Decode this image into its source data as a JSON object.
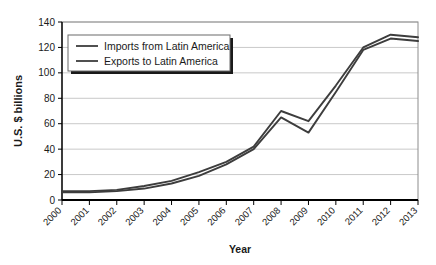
{
  "chart_data": {
    "type": "line",
    "title": "",
    "xlabel": "Year",
    "ylabel": "U.S. $ billions",
    "categories": [
      "2000",
      "2001",
      "2002",
      "2003",
      "2004",
      "2005",
      "2006",
      "2007",
      "2008",
      "2009",
      "2010",
      "2011",
      "2012",
      "2013"
    ],
    "xlim": [
      2000,
      2013
    ],
    "ylim": [
      0,
      140
    ],
    "yticks": [
      0,
      20,
      40,
      60,
      80,
      100,
      120,
      140
    ],
    "ytick_labels": [
      "0",
      "20",
      "40",
      "60",
      "80",
      "100",
      "120",
      "140"
    ],
    "grid": true,
    "grid_axis": "y",
    "legend_position": "upper-left-inside",
    "series": [
      {
        "name": "Imports from Latin America",
        "color": "#3d3d3d",
        "values": [
          7,
          7,
          8,
          11,
          15,
          22,
          30,
          42,
          70,
          62,
          90,
          120,
          130,
          128
        ]
      },
      {
        "name": "Exports to Latin America",
        "color": "#3d3d3d",
        "values": [
          6,
          6,
          7,
          9,
          13,
          19,
          28,
          40,
          65,
          53,
          85,
          118,
          127,
          125
        ]
      }
    ]
  },
  "legend": {
    "entries": [
      {
        "label": "Imports from Latin America"
      },
      {
        "label": "Exports to Latin America"
      }
    ]
  },
  "axes": {
    "y_axis_title": "U.S. $ billions",
    "x_axis_title": "Year"
  },
  "colors": {
    "line": "#3d3d3d",
    "grid": "#c9c9c9",
    "axis": "#000000",
    "text": "#1a1a1a",
    "background": "#ffffff",
    "legend_shadow": "#1a1a1a"
  }
}
